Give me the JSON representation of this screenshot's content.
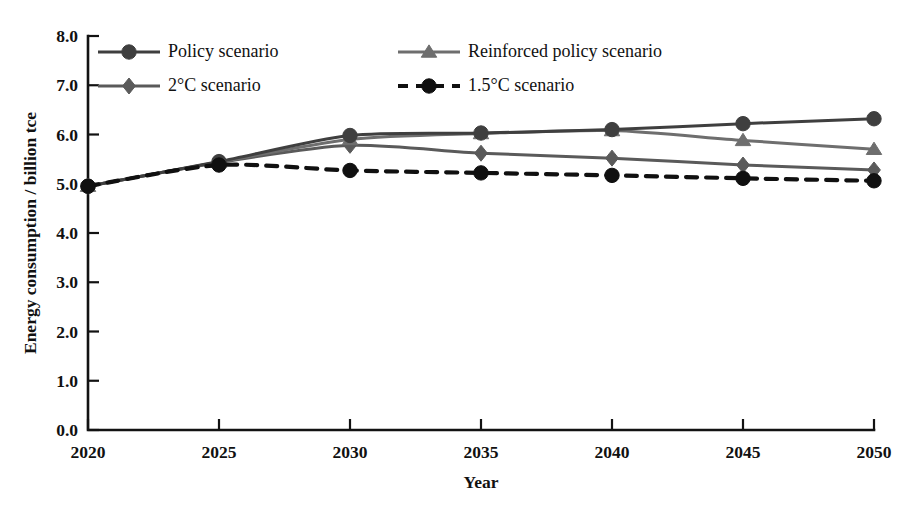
{
  "chart_data": {
    "type": "line",
    "title": "",
    "xlabel": "Year",
    "ylabel": "Energy consumption / billion tce",
    "categories": [
      "2020",
      "2025",
      "2030",
      "2035",
      "2040",
      "2045",
      "2050"
    ],
    "x": [
      2020,
      2025,
      2030,
      2035,
      2040,
      2045,
      2050
    ],
    "xlim": [
      2020,
      2050
    ],
    "ylim": [
      0.0,
      8.0
    ],
    "xticks": [
      "2020",
      "2025",
      "2030",
      "2035",
      "2040",
      "2045",
      "2050"
    ],
    "yticks": [
      "0.0",
      "1.0",
      "2.0",
      "3.0",
      "4.0",
      "5.0",
      "6.0",
      "7.0",
      "8.0"
    ],
    "grid": false,
    "legend_position": "top-inside",
    "series": [
      {
        "name": "Policy scenario",
        "marker": "circle",
        "linestyle": "solid",
        "color": "#3f3f3f",
        "values": [
          4.95,
          5.45,
          5.98,
          6.03,
          6.1,
          6.22,
          6.32
        ]
      },
      {
        "name": "Reinforced policy scenario",
        "marker": "triangle",
        "linestyle": "solid",
        "color": "#6e6e6e",
        "values": [
          4.95,
          5.44,
          5.9,
          6.02,
          6.08,
          5.88,
          5.7
        ]
      },
      {
        "name": "2°C scenario",
        "marker": "diamond",
        "linestyle": "solid",
        "color": "#5a5a5a",
        "values": [
          4.95,
          5.43,
          5.78,
          5.62,
          5.52,
          5.38,
          5.28
        ]
      },
      {
        "name": "1.5°C scenario",
        "marker": "circle",
        "linestyle": "dashed",
        "color": "#101010",
        "values": [
          4.95,
          5.38,
          5.27,
          5.22,
          5.17,
          5.11,
          5.06
        ]
      }
    ]
  },
  "legend": {
    "entries": [
      {
        "label": "Policy scenario"
      },
      {
        "label": "Reinforced policy scenario"
      },
      {
        "label": "2°C scenario"
      },
      {
        "label": "1.5°C scenario"
      }
    ]
  },
  "axes": {
    "x_title": "Year",
    "y_title": "Energy consumption / billion tce"
  }
}
